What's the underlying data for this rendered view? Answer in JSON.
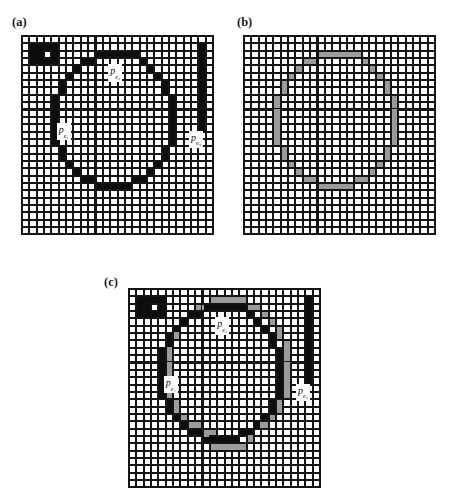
{
  "figure": {
    "caption_labels": {
      "a": "(a)",
      "b": "(b)",
      "c": "(c)"
    }
  },
  "colors": {
    "grid_line": "#141414",
    "cell_background": "#ffffff",
    "black_cell": "#0d0d0d",
    "gray_cell": "#9b9b9b",
    "text": "#111111",
    "page_background": "#ffffff"
  },
  "chart_data": {
    "type": "heatmap",
    "title": "",
    "subtitle": "",
    "xlabel": "",
    "ylabel": "",
    "grid": true,
    "legend_position": "none",
    "grid_columns": 26,
    "grid_rows": 27,
    "cell_value_legend": {
      "0": "empty (white)",
      "1": "black",
      "2": "gray",
      "3": "black and gray overlap"
    },
    "panels": [
      {
        "id": "a",
        "label": "(a)",
        "columns": 26,
        "rows": 27,
        "black_cells": [
          [
            1,
            1
          ],
          [
            2,
            1
          ],
          [
            3,
            1
          ],
          [
            4,
            1
          ],
          [
            1,
            2
          ],
          [
            2,
            2
          ],
          [
            4,
            2
          ],
          [
            1,
            3
          ],
          [
            2,
            3
          ],
          [
            3,
            3
          ],
          [
            4,
            3
          ],
          [
            10,
            2
          ],
          [
            11,
            2
          ],
          [
            12,
            2
          ],
          [
            13,
            2
          ],
          [
            14,
            2
          ],
          [
            15,
            2
          ],
          [
            8,
            3
          ],
          [
            9,
            3
          ],
          [
            16,
            3
          ],
          [
            7,
            4
          ],
          [
            17,
            4
          ],
          [
            6,
            5
          ],
          [
            18,
            5
          ],
          [
            5,
            6
          ],
          [
            19,
            6
          ],
          [
            5,
            7
          ],
          [
            19,
            7
          ],
          [
            4,
            8
          ],
          [
            20,
            8
          ],
          [
            4,
            9
          ],
          [
            20,
            9
          ],
          [
            4,
            10
          ],
          [
            20,
            10
          ],
          [
            4,
            11
          ],
          [
            20,
            11
          ],
          [
            4,
            12
          ],
          [
            20,
            12
          ],
          [
            4,
            13
          ],
          [
            20,
            13
          ],
          [
            4,
            14
          ],
          [
            20,
            14
          ],
          [
            5,
            15
          ],
          [
            19,
            15
          ],
          [
            5,
            16
          ],
          [
            19,
            16
          ],
          [
            6,
            17
          ],
          [
            18,
            17
          ],
          [
            7,
            18
          ],
          [
            17,
            18
          ],
          [
            8,
            19
          ],
          [
            9,
            19
          ],
          [
            15,
            19
          ],
          [
            16,
            19
          ],
          [
            10,
            20
          ],
          [
            11,
            20
          ],
          [
            12,
            20
          ],
          [
            13,
            20
          ],
          [
            14,
            20
          ],
          [
            24,
            1
          ],
          [
            24,
            2
          ],
          [
            24,
            3
          ],
          [
            24,
            4
          ],
          [
            24,
            5
          ],
          [
            24,
            6
          ],
          [
            24,
            7
          ],
          [
            24,
            8
          ],
          [
            24,
            9
          ],
          [
            24,
            10
          ],
          [
            24,
            11
          ],
          [
            24,
            12
          ]
        ],
        "gray_cells": [],
        "labels": [
          {
            "text": "p",
            "sub": "e₁",
            "col": 5,
            "row": 12
          },
          {
            "text": "p",
            "sub": "e₂",
            "col": 12,
            "row": 4
          },
          {
            "text": "p",
            "sub": "e₃",
            "col": 23,
            "row": 13
          }
        ]
      },
      {
        "id": "b",
        "label": "(b)",
        "columns": 26,
        "rows": 27,
        "black_cells": [],
        "gray_cells": [
          [
            10,
            2
          ],
          [
            11,
            2
          ],
          [
            12,
            2
          ],
          [
            13,
            2
          ],
          [
            14,
            2
          ],
          [
            15,
            2
          ],
          [
            8,
            3
          ],
          [
            9,
            3
          ],
          [
            16,
            3
          ],
          [
            7,
            4
          ],
          [
            17,
            4
          ],
          [
            6,
            5
          ],
          [
            18,
            5
          ],
          [
            5,
            6
          ],
          [
            19,
            6
          ],
          [
            5,
            7
          ],
          [
            19,
            7
          ],
          [
            4,
            8
          ],
          [
            20,
            8
          ],
          [
            4,
            9
          ],
          [
            20,
            9
          ],
          [
            4,
            10
          ],
          [
            20,
            10
          ],
          [
            4,
            11
          ],
          [
            20,
            11
          ],
          [
            4,
            12
          ],
          [
            20,
            12
          ],
          [
            4,
            13
          ],
          [
            20,
            13
          ],
          [
            4,
            14
          ],
          [
            20,
            14
          ],
          [
            5,
            15
          ],
          [
            19,
            15
          ],
          [
            5,
            16
          ],
          [
            19,
            16
          ],
          [
            6,
            17
          ],
          [
            18,
            17
          ],
          [
            7,
            18
          ],
          [
            17,
            18
          ],
          [
            8,
            19
          ],
          [
            9,
            19
          ],
          [
            15,
            19
          ],
          [
            16,
            19
          ],
          [
            10,
            20
          ],
          [
            11,
            20
          ],
          [
            12,
            20
          ],
          [
            13,
            20
          ],
          [
            14,
            20
          ]
        ],
        "labels": []
      },
      {
        "id": "c",
        "label": "(c)",
        "columns": 26,
        "rows": 27,
        "black_cells": [
          [
            1,
            1
          ],
          [
            2,
            1
          ],
          [
            3,
            1
          ],
          [
            4,
            1
          ],
          [
            1,
            2
          ],
          [
            2,
            2
          ],
          [
            4,
            2
          ],
          [
            1,
            3
          ],
          [
            2,
            3
          ],
          [
            3,
            3
          ],
          [
            4,
            3
          ],
          [
            10,
            2
          ],
          [
            11,
            2
          ],
          [
            12,
            2
          ],
          [
            13,
            2
          ],
          [
            14,
            2
          ],
          [
            15,
            2
          ],
          [
            8,
            3
          ],
          [
            9,
            3
          ],
          [
            16,
            3
          ],
          [
            7,
            4
          ],
          [
            17,
            4
          ],
          [
            6,
            5
          ],
          [
            18,
            5
          ],
          [
            5,
            6
          ],
          [
            19,
            6
          ],
          [
            5,
            7
          ],
          [
            19,
            7
          ],
          [
            4,
            8
          ],
          [
            20,
            8
          ],
          [
            4,
            9
          ],
          [
            20,
            9
          ],
          [
            4,
            10
          ],
          [
            20,
            10
          ],
          [
            4,
            11
          ],
          [
            20,
            11
          ],
          [
            4,
            12
          ],
          [
            20,
            12
          ],
          [
            4,
            13
          ],
          [
            20,
            13
          ],
          [
            4,
            14
          ],
          [
            20,
            14
          ],
          [
            5,
            15
          ],
          [
            19,
            15
          ],
          [
            5,
            16
          ],
          [
            19,
            16
          ],
          [
            6,
            17
          ],
          [
            18,
            17
          ],
          [
            7,
            18
          ],
          [
            17,
            18
          ],
          [
            8,
            19
          ],
          [
            9,
            19
          ],
          [
            15,
            19
          ],
          [
            16,
            19
          ],
          [
            10,
            20
          ],
          [
            11,
            20
          ],
          [
            12,
            20
          ],
          [
            13,
            20
          ],
          [
            14,
            20
          ],
          [
            24,
            1
          ],
          [
            24,
            2
          ],
          [
            24,
            3
          ],
          [
            24,
            4
          ],
          [
            24,
            5
          ],
          [
            24,
            6
          ],
          [
            24,
            7
          ],
          [
            24,
            8
          ],
          [
            24,
            9
          ],
          [
            24,
            10
          ],
          [
            24,
            11
          ],
          [
            24,
            12
          ]
        ],
        "gray_cells": [
          [
            11,
            1
          ],
          [
            12,
            1
          ],
          [
            13,
            1
          ],
          [
            14,
            1
          ],
          [
            15,
            1
          ],
          [
            9,
            2
          ],
          [
            10,
            2
          ],
          [
            16,
            2
          ],
          [
            17,
            2
          ],
          [
            8,
            3
          ],
          [
            18,
            3
          ],
          [
            7,
            4
          ],
          [
            19,
            4
          ],
          [
            6,
            5
          ],
          [
            20,
            5
          ],
          [
            6,
            6
          ],
          [
            20,
            6
          ],
          [
            5,
            7
          ],
          [
            21,
            7
          ],
          [
            5,
            8
          ],
          [
            21,
            8
          ],
          [
            5,
            9
          ],
          [
            21,
            9
          ],
          [
            5,
            10
          ],
          [
            21,
            10
          ],
          [
            5,
            11
          ],
          [
            21,
            11
          ],
          [
            5,
            12
          ],
          [
            21,
            12
          ],
          [
            5,
            13
          ],
          [
            21,
            13
          ],
          [
            5,
            14
          ],
          [
            21,
            14
          ],
          [
            6,
            15
          ],
          [
            20,
            15
          ],
          [
            6,
            16
          ],
          [
            20,
            16
          ],
          [
            7,
            17
          ],
          [
            19,
            17
          ],
          [
            8,
            18
          ],
          [
            9,
            18
          ],
          [
            17,
            18
          ],
          [
            18,
            18
          ],
          [
            10,
            19
          ],
          [
            11,
            19
          ],
          [
            15,
            19
          ],
          [
            16,
            19
          ],
          [
            11,
            21
          ],
          [
            12,
            21
          ],
          [
            13,
            21
          ],
          [
            14,
            21
          ],
          [
            15,
            21
          ],
          [
            10,
            20
          ],
          [
            16,
            20
          ]
        ],
        "labels": [
          {
            "text": "p",
            "sub": "e₁",
            "col": 5,
            "row": 12
          },
          {
            "text": "p",
            "sub": "e₂",
            "col": 12,
            "row": 4
          },
          {
            "text": "p",
            "sub": "e₃",
            "col": 23,
            "row": 13
          }
        ]
      }
    ]
  }
}
